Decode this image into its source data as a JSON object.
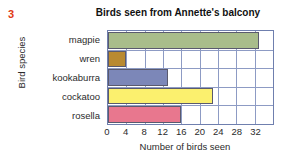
{
  "question_number": "3",
  "question_number_color": "#e03a14",
  "chart_data": {
    "type": "bar",
    "orientation": "horizontal",
    "title": "Birds seen from Annette's balcony",
    "xlabel": "Number of birds seen",
    "ylabel": "Bird species",
    "categories": [
      "magpie",
      "wren",
      "kookaburra",
      "cockatoo",
      "rosella"
    ],
    "values": [
      33,
      4,
      13,
      23,
      16
    ],
    "bar_colors": [
      "#a9bd8b",
      "#b98a31",
      "#7c87b8",
      "#fbf06e",
      "#e8778e"
    ],
    "xlim": [
      0,
      36
    ],
    "xticks": [
      0,
      4,
      8,
      12,
      16,
      20,
      24,
      28,
      32
    ],
    "xtick_labels": [
      "0",
      "4",
      "8",
      "12",
      "16",
      "20",
      "24",
      "28",
      "32"
    ],
    "grid": true,
    "grid_color": "#8d9bc4",
    "legend": "none"
  }
}
